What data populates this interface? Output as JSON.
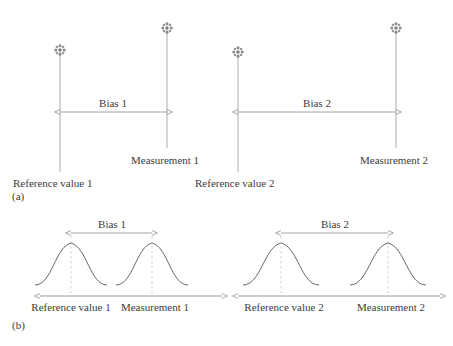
{
  "figure": {
    "type": "diagram",
    "background_color": "#ffffff",
    "line_color": "#808080",
    "curve_color": "#555555",
    "dash_color": "#bbbbbb",
    "text_color": "#3c3c3c"
  },
  "panel_a": {
    "label": "(a)",
    "marker_icon": "asterisk-star-marker",
    "groups": [
      {
        "id": "group1",
        "bias_label": "Bias 1",
        "reference_label": "Reference value 1",
        "measurement_label": "Measurement 1",
        "reference_x": 60,
        "measurement_x": 167,
        "reference_top_y": 50,
        "measurement_top_y": 28,
        "reference_bottom_y": 172,
        "measurement_bottom_y": 148,
        "bias_arrow_y": 112
      },
      {
        "id": "group2",
        "bias_label": "Bias 2",
        "reference_label": "Reference value 2",
        "measurement_label": "Measurement 2",
        "reference_x": 238,
        "measurement_x": 396,
        "reference_top_y": 52,
        "measurement_top_y": 28,
        "reference_bottom_y": 172,
        "measurement_bottom_y": 148,
        "bias_arrow_y": 112
      }
    ]
  },
  "panel_b": {
    "label": "(b)",
    "groups": [
      {
        "id": "group1",
        "bias_label": "Bias 1",
        "reference_label": "Reference value 1",
        "measurement_label": "Measurement 1",
        "axis_start_x": 40,
        "axis_end_x": 222,
        "axis_y": 296,
        "axis_arrow_left": true,
        "axis_arrow_right": true,
        "reference_peak_x": 71,
        "measurement_peak_x": 152,
        "peak_y": 243,
        "baseline_y": 285,
        "curve_half_width": 36,
        "bias_arrow_y": 233
      },
      {
        "id": "group2",
        "bias_label": "Bias 2",
        "reference_label": "Reference value 2",
        "measurement_label": "Measurement 2",
        "axis_start_x": 238,
        "axis_end_x": 440,
        "axis_y": 296,
        "axis_arrow_left": true,
        "axis_arrow_right": true,
        "reference_peak_x": 281,
        "measurement_peak_x": 388,
        "peak_y": 243,
        "baseline_y": 285,
        "curve_half_width": 38,
        "bias_arrow_y": 233
      }
    ]
  }
}
